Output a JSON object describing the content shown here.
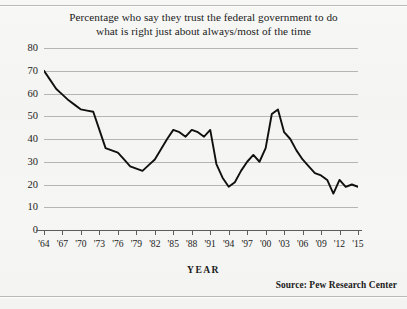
{
  "title": {
    "line1": "Percentage who say they trust the federal government to do",
    "line2": "what is right just about always/most of the time"
  },
  "axis": {
    "x_title": "YEAR",
    "y_ticks": [
      "80",
      "70",
      "60",
      "50",
      "40",
      "30",
      "20",
      "10",
      "0"
    ],
    "x_ticks": [
      "'64",
      "'67",
      "'70",
      "'73",
      "'76",
      "'79",
      "'82",
      "'85",
      "'88",
      "'91",
      "'94",
      "'97",
      "'00",
      "'03",
      "'06",
      "'09",
      "'12",
      "'15"
    ]
  },
  "source": "Source:  Pew Research Center",
  "colors": {
    "line": "#101010",
    "grid": "#a9a9a7",
    "axis": "#5d5d5b",
    "paper": "#f5f5f3",
    "text": "#1b1b1b"
  },
  "chart_data": {
    "type": "line",
    "title": "Percentage who say they trust the federal government to do what is right just about always/most of the time",
    "xlabel": "YEAR",
    "ylabel": "",
    "xlim": [
      1964,
      2015
    ],
    "ylim": [
      0,
      80
    ],
    "grid": true,
    "legend": false,
    "source": "Pew Research Center",
    "series": [
      {
        "name": "Trust in federal government (%)",
        "x": [
          1964,
          1966,
          1968,
          1970,
          1972,
          1974,
          1976,
          1978,
          1980,
          1982,
          1984,
          1985,
          1986,
          1987,
          1988,
          1989,
          1990,
          1991,
          1992,
          1993,
          1994,
          1995,
          1996,
          1997,
          1998,
          1999,
          2000,
          2001,
          2002,
          2003,
          2004,
          2005,
          2006,
          2007,
          2008,
          2009,
          2010,
          2011,
          2012,
          2013,
          2014,
          2015
        ],
        "values": [
          70,
          62,
          57,
          53,
          52,
          36,
          34,
          28,
          26,
          31,
          40,
          44,
          43,
          41,
          44,
          43,
          41,
          44,
          29,
          23,
          19,
          21,
          26,
          30,
          33,
          30,
          36,
          51,
          53,
          43,
          40,
          35,
          31,
          28,
          25,
          24,
          22,
          16,
          22,
          19,
          20,
          19
        ]
      }
    ],
    "annotations": [
      {
        "text": "series high at start",
        "x": 1964,
        "y": 70
      },
      {
        "text": "post-9/11 peak",
        "x": 2002,
        "y": 53
      },
      {
        "text": "series low",
        "x": 2011,
        "y": 16
      }
    ]
  }
}
